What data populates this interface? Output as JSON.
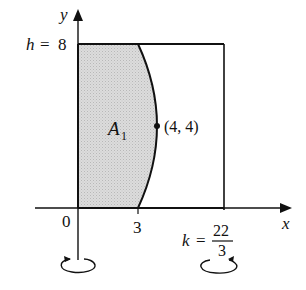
{
  "figure": {
    "type": "volume-of-revolution diagram",
    "axes": {
      "x_label": "x",
      "y_label": "y",
      "origin_label": "0"
    },
    "height_label": {
      "var": "h",
      "eq": "=",
      "value": "8"
    },
    "x_tick_label": "3",
    "k_label": {
      "var": "k",
      "eq": "=",
      "numerator": "22",
      "denominator": "3"
    },
    "region_label": {
      "letter": "A",
      "subscript": "1"
    },
    "point_label": "(4, 4)",
    "colors": {
      "region_fill": "#d4d4d4",
      "line": "#111111"
    }
  }
}
